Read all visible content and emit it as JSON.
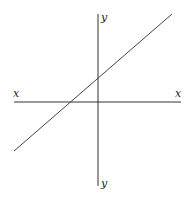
{
  "diagram": {
    "type": "coordinate-axes-with-line",
    "axes": {
      "x_label_left": "x",
      "x_label_right": "x",
      "y_label_top": "y",
      "y_label_bottom": "y",
      "color": "#333333"
    },
    "line": {
      "description": "straight line with positive slope crossing x-axis left of origin and y-axis above origin",
      "color": "#444444"
    }
  }
}
